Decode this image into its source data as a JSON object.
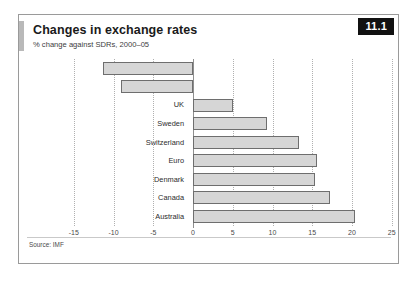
{
  "card": {
    "title": "Changes in exchange rates",
    "subtitle": "% change against SDRs, 2000–05",
    "badge": "11.1",
    "source": "Source: IMF"
  },
  "chart_data": {
    "type": "bar",
    "orientation": "horizontal",
    "title": "Changes in exchange rates",
    "subtitle": "% change against SDRs, 2000–05",
    "xlabel": "",
    "ylabel": "",
    "xlim": [
      -15,
      25
    ],
    "xticks": [
      -15,
      -10,
      -5,
      0,
      5,
      10,
      15,
      20,
      25
    ],
    "xtick_labels": [
      "-15",
      "-10",
      "-5",
      "0",
      "5",
      "10",
      "15",
      "20",
      "25"
    ],
    "grid": true,
    "grid_style": "dotted-vertical",
    "legend": false,
    "categories": [
      "Japan",
      "USA",
      "UK",
      "Sweden",
      "Switzerland",
      "Euro",
      "Denmark",
      "Canada",
      "Australia"
    ],
    "values": [
      -11.3,
      -9.0,
      5.0,
      9.3,
      13.3,
      15.6,
      15.3,
      17.2,
      20.4
    ],
    "bar_fill": "#d6d6d6",
    "bar_border": "#6e6e6e",
    "source": "Source: IMF"
  }
}
